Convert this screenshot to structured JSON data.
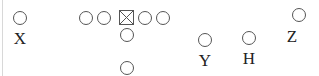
{
  "diagram": {
    "type": "football-formation",
    "players": [
      {
        "id": "x",
        "label": "X",
        "role": "receiver"
      },
      {
        "id": "y",
        "label": "Y",
        "role": "receiver"
      },
      {
        "id": "h",
        "label": "H",
        "role": "receiver"
      },
      {
        "id": "z",
        "label": "Z",
        "role": "receiver"
      }
    ],
    "offensive_line": {
      "count": 5,
      "center_symbol": "boxed-x"
    },
    "backfield": {
      "quarterback": "under-center",
      "running_back": "i-back"
    }
  }
}
